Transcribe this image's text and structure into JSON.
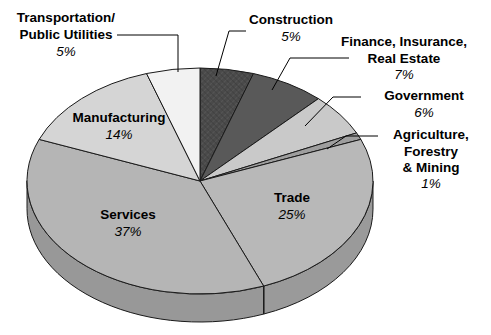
{
  "chart_data": {
    "type": "pie",
    "title": "",
    "subtitle": "",
    "xlabel": "",
    "ylabel": "",
    "legend_position": "none",
    "grid": false,
    "units": "percent",
    "total": 100,
    "categories": [
      "Construction",
      "Finance, Insurance, Real Estate",
      "Government",
      "Agriculture, Forestry & Mining",
      "Trade",
      "Services",
      "Manufacturing",
      "Transportation/ Public Utilities"
    ],
    "values": [
      5,
      7,
      6,
      1,
      25,
      37,
      14,
      5
    ],
    "slices": [
      {
        "id": "construction",
        "label_lines": [
          "Construction"
        ],
        "percent_text": "5%",
        "value": 5,
        "color": "#4a4a4a",
        "side_color": "#333333",
        "pattern": "crosshatch",
        "label_placement": "outside",
        "label_anchor": "middle",
        "label_x": 291,
        "label_y": 24,
        "percent_x": 291,
        "percent_y": 41,
        "leader": "M246,31 L229,31 L216,76"
      },
      {
        "id": "finance-insurance-real-estate",
        "label_lines": [
          "Finance, Insurance,",
          "Real Estate"
        ],
        "percent_text": "7%",
        "value": 7,
        "color": "#595959",
        "side_color": "#3f3f3f",
        "pattern": "solid",
        "label_placement": "outside",
        "label_anchor": "middle",
        "label_x": 404,
        "label_y": 46,
        "percent_x": 404,
        "percent_y": 79,
        "leader": "M349,58 L290,58 L272,90"
      },
      {
        "id": "government",
        "label_lines": [
          "Government"
        ],
        "percent_text": "6%",
        "value": 6,
        "color": "#c9c9c9",
        "side_color": "#a8a8a8",
        "pattern": "solid",
        "label_placement": "outside",
        "label_anchor": "middle",
        "label_x": 424,
        "label_y": 100,
        "percent_x": 424,
        "percent_y": 117,
        "leader": "M361,97 L333,97 L305,126"
      },
      {
        "id": "agriculture-forestry-mining",
        "label_lines": [
          "Agriculture,",
          "Forestry",
          "& Mining"
        ],
        "percent_text": "1%",
        "value": 1,
        "color": "#9e9e9e",
        "side_color": "#858585",
        "pattern": "solid",
        "label_placement": "outside",
        "label_anchor": "middle",
        "label_x": 431,
        "label_y": 139,
        "percent_x": 431,
        "percent_y": 188,
        "leader": "M378,136 L346,136 L327,149"
      },
      {
        "id": "trade",
        "label_lines": [
          "Trade"
        ],
        "percent_text": "25%",
        "value": 25,
        "color": "#b8b8b8",
        "side_color": "#9a9a9a",
        "pattern": "solid",
        "label_placement": "inside",
        "label_anchor": "middle",
        "label_x": 292,
        "label_y": 202,
        "percent_x": 292,
        "percent_y": 219,
        "leader": ""
      },
      {
        "id": "services",
        "label_lines": [
          "Services"
        ],
        "percent_text": "37%",
        "value": 37,
        "color": "#b5b5b5",
        "side_color": "#989898",
        "pattern": "solid",
        "label_placement": "inside",
        "label_anchor": "middle",
        "label_x": 128,
        "label_y": 219,
        "percent_x": 128,
        "percent_y": 236,
        "leader": ""
      },
      {
        "id": "manufacturing",
        "label_lines": [
          "Manufacturing"
        ],
        "percent_text": "14%",
        "value": 14,
        "color": "#d5d5d5",
        "side_color": "#b2b2b2",
        "pattern": "solid",
        "label_placement": "inside",
        "label_anchor": "middle",
        "label_x": 119,
        "label_y": 122,
        "percent_x": 119,
        "percent_y": 139,
        "leader": ""
      },
      {
        "id": "transportation-public-utilities",
        "label_lines": [
          "Transportation/",
          "Public Utilities"
        ],
        "percent_text": "5%",
        "value": 5,
        "color": "#f2f2f2",
        "side_color": "#d0d0d0",
        "pattern": "solid",
        "label_placement": "outside",
        "label_anchor": "middle",
        "label_x": 66,
        "label_y": 22,
        "percent_x": 66,
        "percent_y": 56,
        "leader": "M117,35 L178,35 L178,72"
      }
    ],
    "geometry": {
      "center_x": 200,
      "center_y": 181,
      "radius_x": 173,
      "radius_y": 113,
      "depth": 28,
      "start_angle_deg": -90,
      "direction": "clockwise"
    },
    "colors": {
      "background": "#ffffff",
      "outline": "#1a1a1a",
      "text": "#000000"
    }
  }
}
